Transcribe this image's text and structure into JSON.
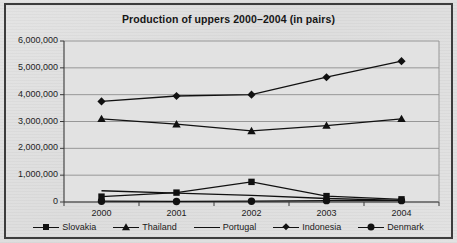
{
  "chart_data": {
    "type": "line",
    "title": "Production of uppers 2000–2004 (in pairs)",
    "xlabel": "",
    "ylabel": "",
    "categories": [
      "2000",
      "2001",
      "2002",
      "2003",
      "2004"
    ],
    "ylim": [
      0,
      6000000
    ],
    "ytick_labels": [
      "6,000,000",
      "5,000,000",
      "4,000,000",
      "3,000,000",
      "2,000,000",
      "1,000,000",
      "0"
    ],
    "ytick_values": [
      6000000,
      5000000,
      4000000,
      3000000,
      2000000,
      1000000,
      0
    ],
    "grid": true,
    "legend_position": "bottom",
    "series": [
      {
        "name": "Slovakia",
        "marker": "square",
        "color": "#111111",
        "values": [
          200000,
          350000,
          750000,
          220000,
          100000
        ]
      },
      {
        "name": "Thailand",
        "marker": "triangle",
        "color": "#111111",
        "values": [
          3100000,
          2900000,
          2650000,
          2850000,
          3100000
        ]
      },
      {
        "name": "Portugal",
        "marker": "none",
        "color": "#111111",
        "values": [
          420000,
          330000,
          250000,
          130000,
          60000
        ]
      },
      {
        "name": "Indonesia",
        "marker": "diamond",
        "color": "#111111",
        "values": [
          3750000,
          3950000,
          4000000,
          4650000,
          5250000
        ]
      },
      {
        "name": "Denmark",
        "marker": "circle",
        "color": "#111111",
        "values": [
          30000,
          20000,
          30000,
          50000,
          50000
        ]
      }
    ]
  },
  "legend": {
    "items": [
      {
        "label": "Slovakia",
        "marker": "square"
      },
      {
        "label": "Thailand",
        "marker": "triangle"
      },
      {
        "label": "Portugal",
        "marker": "none"
      },
      {
        "label": "Indonesia",
        "marker": "diamond"
      },
      {
        "label": "Denmark",
        "marker": "circle"
      }
    ]
  },
  "style": {
    "plot_background": "#e2e2e2",
    "grid_color": "#8e8e8e",
    "axis_color": "#3a3a3a",
    "line_color": "#111111",
    "frame_color": "#3c3c3c"
  }
}
